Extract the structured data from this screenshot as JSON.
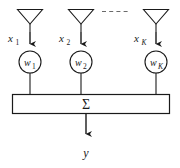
{
  "diagram": {
    "stroke_color": "#1a1a1a",
    "background_color": "#ffffff",
    "output_label": "y",
    "sum_label": "Σ",
    "ellipsis": "- - - - -",
    "channels": [
      {
        "id": "channel-1",
        "input_base": "x",
        "input_sub": "1",
        "weight_base": "w",
        "weight_sub": "1",
        "cx": 30
      },
      {
        "id": "channel-2",
        "input_base": "x",
        "input_sub": "2",
        "weight_base": "w",
        "weight_sub": "2",
        "cx": 81
      },
      {
        "id": "channel-k",
        "input_base": "x",
        "input_sub": "K",
        "weight_base": "w",
        "weight_sub": "K",
        "cx": 156
      }
    ]
  }
}
